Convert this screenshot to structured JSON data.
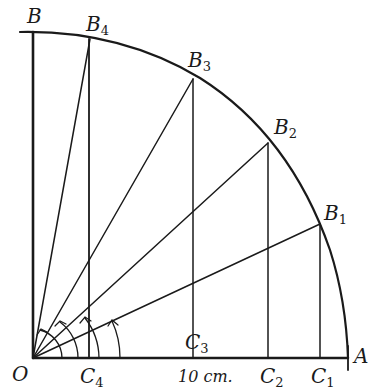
{
  "diagram": {
    "type": "geometry",
    "points": {
      "O": {
        "label": "O",
        "x": 33,
        "y": 358
      },
      "A": {
        "label": "A",
        "x": 348,
        "y": 358
      },
      "B": {
        "label": "B",
        "x": 33,
        "y": 32
      },
      "B1": {
        "label": "B",
        "sub": "1",
        "x": 320,
        "y": 224
      },
      "B2": {
        "label": "B",
        "sub": "2",
        "x": 268,
        "y": 143
      },
      "B3": {
        "label": "B",
        "sub": "3",
        "x": 193,
        "y": 79
      },
      "B4": {
        "label": "B",
        "sub": "4",
        "x": 90,
        "y": 39
      },
      "C1": {
        "label": "C",
        "sub": "1",
        "x": 320,
        "y": 358
      },
      "C2": {
        "label": "C",
        "sub": "2",
        "x": 268,
        "y": 358
      },
      "C3": {
        "label": "C",
        "sub": "3",
        "x": 193,
        "y": 358
      },
      "C4": {
        "label": "C",
        "sub": "4",
        "x": 89,
        "y": 358
      }
    },
    "scale_label": "10 cm.",
    "colors": {
      "ink": "#1a1a1a",
      "background": "#ffffff"
    }
  }
}
